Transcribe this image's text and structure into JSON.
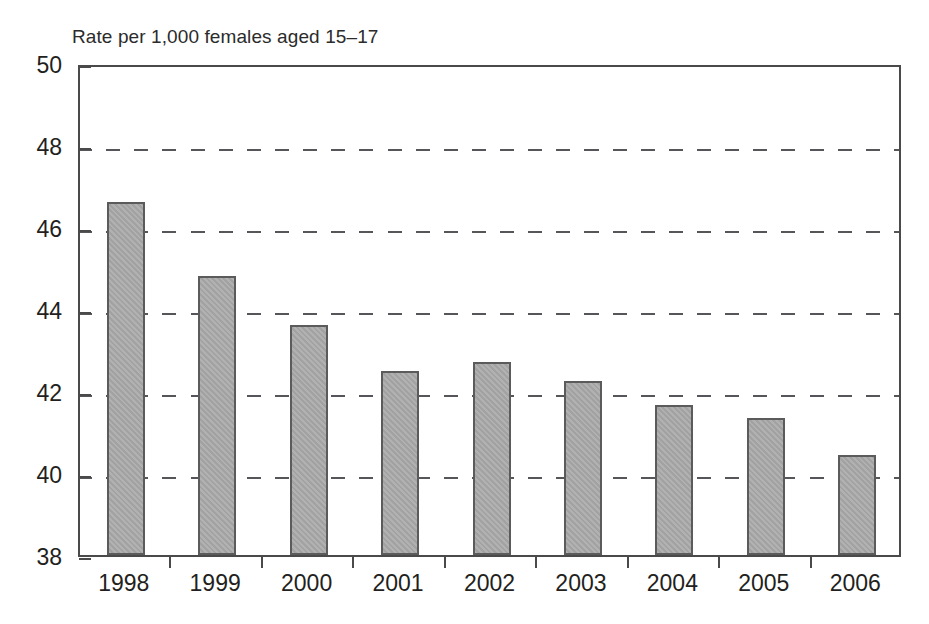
{
  "figure": {
    "axis_title": "Rate per 1,000 females aged 15–17",
    "background_color": "#ffffff",
    "bar_fill_color": "#a2a2a2",
    "bar_border_color": "#5b5b5b",
    "axis_color": "#4a4a4a",
    "gridline_color": "#55555a",
    "text_color": "#231f20"
  },
  "chart_data": {
    "type": "bar",
    "title": "",
    "subtitle": "",
    "xlabel": "",
    "ylabel": "Rate per 1,000 females aged 15–17",
    "categories": [
      "1998",
      "1999",
      "2000",
      "2001",
      "2002",
      "2003",
      "2004",
      "2005",
      "2006"
    ],
    "values": [
      46.6,
      44.8,
      43.6,
      42.5,
      42.7,
      42.25,
      41.65,
      41.35,
      40.45
    ],
    "series": [
      {
        "name": "Birth rate",
        "values": [
          46.6,
          44.8,
          43.6,
          42.5,
          42.7,
          42.25,
          41.65,
          41.35,
          40.45
        ]
      }
    ],
    "ylim": [
      38,
      50
    ],
    "yticks": [
      38,
      40,
      42,
      44,
      46,
      48,
      50
    ],
    "ytick_labels": [
      "38",
      "40",
      "42",
      "44",
      "46",
      "48",
      "50"
    ],
    "xtick_labels": [
      "1998",
      "1999",
      "2000",
      "2001",
      "2002",
      "2003",
      "2004",
      "2005",
      "2006"
    ],
    "grid": true,
    "grid_axis": "y",
    "grid_style": "dashed",
    "legend": false,
    "legend_position": "none",
    "annotations": []
  }
}
